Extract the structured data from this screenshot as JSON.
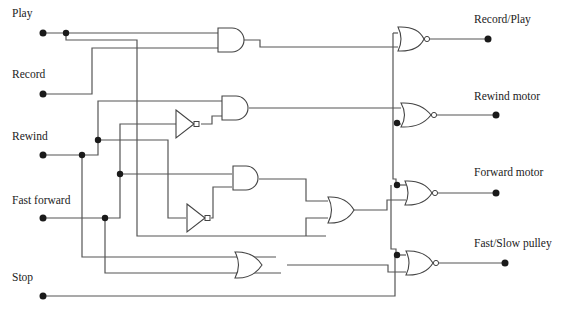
{
  "diagram": {
    "type": "logic-circuit",
    "inputs": [
      {
        "id": "play",
        "label": "Play"
      },
      {
        "id": "record",
        "label": "Record"
      },
      {
        "id": "rewind",
        "label": "Rewind"
      },
      {
        "id": "fast_forward",
        "label": "Fast forward"
      },
      {
        "id": "stop",
        "label": "Stop"
      }
    ],
    "outputs": [
      {
        "id": "record_play",
        "label": "Record/Play"
      },
      {
        "id": "rewind_motor",
        "label": "Rewind motor"
      },
      {
        "id": "forward_motor",
        "label": "Forward motor"
      },
      {
        "id": "fast_slow_pulley",
        "label": "Fast/Slow pulley"
      }
    ],
    "gates": [
      {
        "id": "and1",
        "type": "AND",
        "inputs": [
          "play",
          "record"
        ]
      },
      {
        "id": "not1",
        "type": "NOT",
        "inputs": [
          "fast_forward"
        ]
      },
      {
        "id": "and2",
        "type": "AND",
        "inputs": [
          "rewind",
          "not1"
        ]
      },
      {
        "id": "not2",
        "type": "NOT",
        "inputs": [
          "rewind"
        ]
      },
      {
        "id": "and3",
        "type": "AND",
        "inputs": [
          "fast_forward",
          "not2"
        ]
      },
      {
        "id": "or1",
        "type": "OR",
        "inputs": [
          "and3",
          "play"
        ]
      },
      {
        "id": "or2",
        "type": "OR",
        "inputs": [
          "rewind",
          "fast_forward"
        ]
      },
      {
        "id": "nor1",
        "type": "NOR",
        "inputs": [
          "stop",
          "and1"
        ],
        "output": "record_play"
      },
      {
        "id": "nor2",
        "type": "NOR",
        "inputs": [
          "and2",
          "stop"
        ],
        "output": "rewind_motor"
      },
      {
        "id": "nor3",
        "type": "NOR",
        "inputs": [
          "stop",
          "or1"
        ],
        "output": "forward_motor"
      },
      {
        "id": "nor4",
        "type": "NOR",
        "inputs": [
          "stop",
          "or2"
        ],
        "output": "fast_slow_pulley"
      }
    ]
  }
}
